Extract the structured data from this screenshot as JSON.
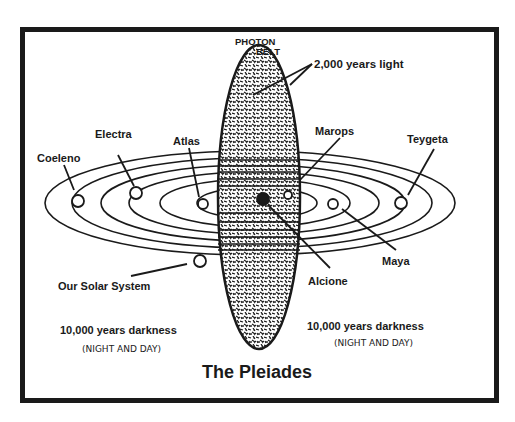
{
  "title": "The Pleiades",
  "photon_belt": {
    "label_line1": "PHOTON",
    "label_line2": "BELT"
  },
  "annotations": {
    "light": "2,000 years light",
    "darkness_left": "10,000 years darkness",
    "darkness_left_sub": "(NIGHT AND DAY)",
    "darkness_right": "10,000 years darkness",
    "darkness_right_sub": "(NIGHT AND DAY)"
  },
  "stars": [
    {
      "name": "Coeleno"
    },
    {
      "name": "Electra"
    },
    {
      "name": "Atlas"
    },
    {
      "name": "Marops"
    },
    {
      "name": "Teygeta"
    },
    {
      "name": "Maya"
    },
    {
      "name": "Alcione"
    },
    {
      "name": "Our Solar System"
    }
  ],
  "colors": {
    "ink": "#1a1a1a",
    "paper": "#ffffff"
  }
}
